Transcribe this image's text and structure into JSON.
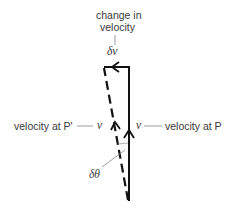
{
  "diagram": {
    "type": "vector-diagram",
    "labels": {
      "change_line1": "change in",
      "change_line2": "velocity",
      "delta_v": "δv",
      "velocity_at_p_prime": "velocity at P'",
      "v_left": "v",
      "v_right": "v",
      "velocity_at_p": "velocity at P",
      "delta_theta": "δθ"
    },
    "vectors": [
      {
        "name": "velocity at P",
        "style": "solid",
        "from": [
          129,
          200
        ],
        "to": [
          129,
          67
        ]
      },
      {
        "name": "velocity at P'",
        "style": "dashed",
        "from": [
          128,
          200
        ],
        "to": [
          104,
          67
        ]
      },
      {
        "name": "change in velocity",
        "style": "solid",
        "from": [
          129,
          67
        ],
        "to": [
          104,
          67
        ]
      }
    ],
    "colors": {
      "stroke": "#111111",
      "text": "#3a3a3a",
      "leader": "#888888"
    }
  }
}
